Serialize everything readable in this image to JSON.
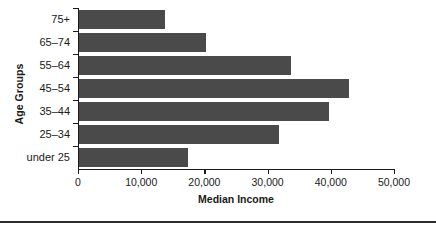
{
  "chart_data": {
    "type": "bar",
    "orientation": "horizontal",
    "title": "",
    "xlabel": "Median Income",
    "ylabel": "Age Groups",
    "categories": [
      "75+",
      "65–74",
      "55–64",
      "45–54",
      "35–44",
      "25–34",
      "under 25"
    ],
    "values": [
      13600,
      20100,
      33500,
      42700,
      39600,
      31600,
      17200
    ],
    "xlim": [
      0,
      50000
    ],
    "xticks": [
      0,
      10000,
      20000,
      30000,
      40000,
      50000
    ],
    "xtick_labels": [
      "0",
      "10,000",
      "20,000",
      "30,000",
      "40,000",
      "50,000"
    ],
    "grid": false,
    "legend": false,
    "bar_color": "#4a4a4a",
    "axis_color": "#1a1a1a"
  },
  "figure": {
    "y_axis_title": "Age Groups",
    "x_axis_title": "Median Income"
  }
}
